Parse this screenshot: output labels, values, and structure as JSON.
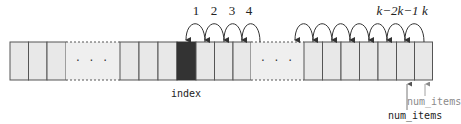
{
  "diagram": {
    "colors": {
      "cell_fill": "#e8e8e8",
      "cell_border": "#555555",
      "removed_cell_fill": "#333333",
      "arc": "#333333",
      "old_pointer": "#8a8a8a"
    },
    "step_labels_left": [
      "1",
      "2",
      "3",
      "4"
    ],
    "step_labels_right": [
      "k−2",
      "k−1",
      "k"
    ],
    "ellipsis": "…",
    "index_label": "index",
    "num_items_old_label": "num_items",
    "num_items_new_label": "num_items"
  }
}
